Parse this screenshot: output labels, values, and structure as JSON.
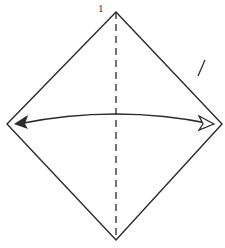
{
  "diagram": {
    "type": "origami-fold-step",
    "step_number": "1",
    "shape": "square-diamond",
    "colors": {
      "line": "#2a2a2a",
      "background": "#ffffff"
    },
    "vertices": {
      "top": [
        116,
        12
      ],
      "left": [
        7,
        124
      ],
      "right": [
        222,
        124
      ],
      "bottom": [
        116,
        240
      ]
    },
    "fold_line": {
      "style": "valley-dashed",
      "from": [
        116,
        12
      ],
      "to": [
        116,
        240
      ]
    },
    "arrow": {
      "style": "curved-double",
      "left_head": "filled",
      "right_head": "open"
    },
    "marks": [
      {
        "type": "slash",
        "from": [
          205,
          60
        ],
        "to": [
          198,
          76
        ]
      }
    ]
  }
}
